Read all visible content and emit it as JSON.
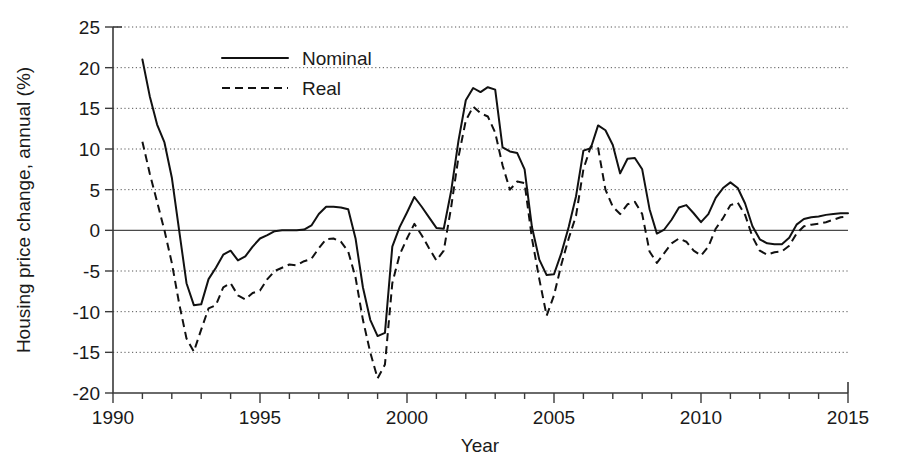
{
  "chart_data": {
    "type": "line",
    "title": "",
    "xlabel": "Year",
    "ylabel": "Housing price change, annual (%)",
    "xlim": [
      1990,
      2015
    ],
    "ylim": [
      -20,
      25
    ],
    "xticks": [
      1990,
      1995,
      2000,
      2005,
      2010,
      2015
    ],
    "xtick_labels": [
      "1990",
      "1995",
      "2000",
      "2005",
      "2010",
      "2015"
    ],
    "yticks": [
      25,
      20,
      15,
      10,
      5,
      0,
      -5,
      -10,
      -15,
      -20
    ],
    "ytick_labels": [
      "25",
      "20",
      "15",
      "10",
      "5",
      "0",
      "-5",
      "-10",
      "-15",
      "-20"
    ],
    "minor_xtick_interval": 1,
    "grid": "horizontal-dotted",
    "zero_line": true,
    "legend_position": "top-left-inside",
    "legend": [
      "Nominal",
      "Real"
    ],
    "series": [
      {
        "name": "Nominal",
        "style": "solid",
        "color": "#111111",
        "x": [
          1991.0,
          1991.25,
          1991.5,
          1991.75,
          1992.0,
          1992.25,
          1992.5,
          1992.75,
          1993.0,
          1993.25,
          1993.5,
          1993.75,
          1994.0,
          1994.25,
          1994.5,
          1994.75,
          1995.0,
          1995.25,
          1995.5,
          1995.75,
          1996.0,
          1996.25,
          1996.5,
          1996.75,
          1997.0,
          1997.25,
          1997.5,
          1997.75,
          1998.0,
          1998.25,
          1998.5,
          1998.75,
          1999.0,
          1999.25,
          1999.5,
          1999.75,
          2000.0,
          2000.25,
          2000.5,
          2000.75,
          2001.0,
          2001.25,
          2001.5,
          2001.75,
          2002.0,
          2002.25,
          2002.5,
          2002.75,
          2003.0,
          2003.25,
          2003.5,
          2003.75,
          2004.0,
          2004.25,
          2004.5,
          2004.75,
          2005.0,
          2005.25,
          2005.5,
          2005.75,
          2006.0,
          2006.25,
          2006.5,
          2006.75,
          2007.0,
          2007.25,
          2007.5,
          2007.75,
          2008.0,
          2008.25,
          2008.5,
          2008.75,
          2009.0,
          2009.25,
          2009.5,
          2009.75,
          2010.0,
          2010.25,
          2010.5,
          2010.75,
          2011.0,
          2011.25,
          2011.5,
          2011.75,
          2012.0,
          2012.25,
          2012.5,
          2012.75,
          2013.0,
          2013.25,
          2013.5,
          2013.75,
          2014.0,
          2014.25,
          2014.5,
          2014.75,
          2015.0
        ],
        "y": [
          21.0,
          16.5,
          13.0,
          10.8,
          6.5,
          0.0,
          -6.5,
          -9.2,
          -9.1,
          -6.0,
          -4.6,
          -3.0,
          -2.5,
          -3.7,
          -3.2,
          -2.0,
          -1.0,
          -0.6,
          -0.1,
          0.0,
          0.0,
          0.0,
          0.1,
          0.6,
          2.0,
          2.9,
          2.9,
          2.8,
          2.6,
          -1.0,
          -7.0,
          -11.0,
          -13.0,
          -12.6,
          -2.0,
          0.4,
          2.2,
          4.1,
          2.9,
          1.6,
          0.3,
          0.2,
          4.8,
          11.0,
          16.0,
          17.5,
          17.0,
          17.6,
          17.3,
          10.2,
          9.7,
          9.5,
          7.5,
          0.4,
          -3.6,
          -5.5,
          -5.4,
          -2.8,
          0.4,
          4.2,
          9.8,
          10.1,
          12.9,
          12.3,
          10.5,
          7.0,
          8.8,
          8.9,
          7.5,
          2.6,
          -0.4,
          0.1,
          1.3,
          2.8,
          3.1,
          2.1,
          1.0,
          2.0,
          4.0,
          5.2,
          5.9,
          5.2,
          3.3,
          0.5,
          -1.1,
          -1.6,
          -1.7,
          -1.7,
          -0.9,
          0.7,
          1.4,
          1.6,
          1.7,
          1.9,
          2.0,
          2.1,
          2.1
        ]
      },
      {
        "name": "Real",
        "style": "dashed",
        "color": "#111111",
        "x": [
          1991.0,
          1991.25,
          1991.5,
          1991.75,
          1992.0,
          1992.25,
          1992.5,
          1992.75,
          1993.0,
          1993.25,
          1993.5,
          1993.75,
          1994.0,
          1994.25,
          1994.5,
          1994.75,
          1995.0,
          1995.25,
          1995.5,
          1995.75,
          1996.0,
          1996.25,
          1996.5,
          1996.75,
          1997.0,
          1997.25,
          1997.5,
          1997.75,
          1998.0,
          1998.25,
          1998.5,
          1998.75,
          1999.0,
          1999.25,
          1999.5,
          1999.75,
          2000.0,
          2000.25,
          2000.5,
          2000.75,
          2001.0,
          2001.25,
          2001.5,
          2001.75,
          2002.0,
          2002.25,
          2002.5,
          2002.75,
          2003.0,
          2003.25,
          2003.5,
          2003.75,
          2004.0,
          2004.25,
          2004.5,
          2004.75,
          2005.0,
          2005.25,
          2005.5,
          2005.75,
          2006.0,
          2006.25,
          2006.5,
          2006.75,
          2007.0,
          2007.25,
          2007.5,
          2007.75,
          2008.0,
          2008.25,
          2008.5,
          2008.75,
          2009.0,
          2009.25,
          2009.5,
          2009.75,
          2010.0,
          2010.25,
          2010.5,
          2010.75,
          2011.0,
          2011.25,
          2011.5,
          2011.75,
          2012.0,
          2012.25,
          2012.5,
          2012.75,
          2013.0,
          2013.25,
          2013.5,
          2013.75,
          2014.0,
          2014.25,
          2014.5,
          2014.75,
          2015.0
        ],
        "y": [
          10.9,
          7.0,
          3.5,
          0.0,
          -4.0,
          -9.0,
          -13.3,
          -14.9,
          -12.2,
          -9.6,
          -9.2,
          -7.0,
          -6.5,
          -8.0,
          -8.5,
          -7.7,
          -7.4,
          -6.0,
          -5.0,
          -4.6,
          -4.2,
          -4.3,
          -3.8,
          -3.5,
          -2.2,
          -1.1,
          -1.0,
          -1.4,
          -2.6,
          -5.8,
          -11.0,
          -15.0,
          -18.2,
          -16.5,
          -6.5,
          -3.0,
          -1.0,
          0.8,
          -0.6,
          -2.2,
          -3.7,
          -2.5,
          2.8,
          9.0,
          13.5,
          15.2,
          14.4,
          14.0,
          12.0,
          8.0,
          5.0,
          6.0,
          5.8,
          -1.0,
          -6.0,
          -10.5,
          -8.0,
          -4.2,
          -1.0,
          1.8,
          7.5,
          10.3,
          10.1,
          5.0,
          2.9,
          2.0,
          3.2,
          3.5,
          2.0,
          -2.6,
          -4.0,
          -2.8,
          -1.6,
          -1.0,
          -1.4,
          -2.5,
          -3.1,
          -2.0,
          0.2,
          1.5,
          3.1,
          3.4,
          1.9,
          -0.8,
          -2.5,
          -3.0,
          -2.7,
          -2.6,
          -1.9,
          -0.4,
          0.5,
          0.7,
          0.8,
          1.0,
          1.3,
          1.6,
          1.7
        ]
      }
    ]
  },
  "figure": {
    "background": "#ffffff",
    "axis_color": "#3a3a3a",
    "line_color": "#111111",
    "grid_color": "#555555"
  }
}
